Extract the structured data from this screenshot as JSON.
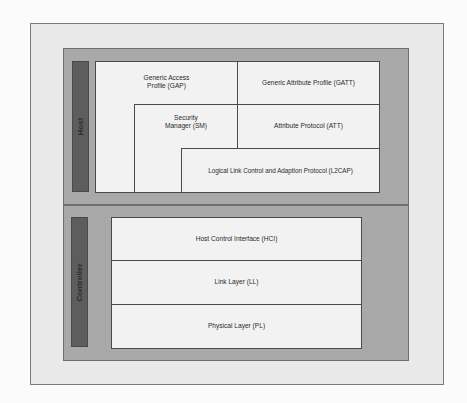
{
  "diagram": {
    "sections": {
      "host": {
        "label": "Host",
        "layers": {
          "gap": "Generic Access Profile (GAP)",
          "gap_line1": "Generic Access",
          "gap_line2": "Profile (GAP)",
          "gatt": "Generic Attribute Profile (GATT)",
          "sm_line1": "Security",
          "sm_line2": "Manager (SM)",
          "att": "Attribute Protocol (ATT)",
          "l2cap": "Logical Link Control and Adaption Protocol (L2CAP)"
        }
      },
      "controller": {
        "label": "Controller",
        "layers": {
          "hci": "Host Control Interface (HCI)",
          "ll": "Link Layer (LL)",
          "pl": "Physical Layer (PL)"
        }
      }
    },
    "colors": {
      "frame_bg": "#e9e9e9",
      "panel_bg": "#a9a9a9",
      "label_bar": "#5d5d5d",
      "box_bg": "#f2f2f2",
      "border": "#4a4a4a"
    }
  }
}
